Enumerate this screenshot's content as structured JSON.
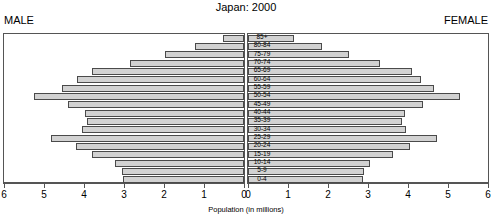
{
  "chart_data": {
    "type": "bar",
    "subtype": "population-pyramid",
    "title": "Japan: 2000",
    "xlabel": "Population (in millions)",
    "ylabel": "",
    "left_label": "MALE",
    "right_label": "FEMALE",
    "categories": [
      "0-4",
      "5-9",
      "10-14",
      "15-19",
      "20-24",
      "25-29",
      "30-34",
      "35-39",
      "40-44",
      "45-49",
      "50-54",
      "55-59",
      "60-64",
      "65-69",
      "70-74",
      "75-79",
      "80-84",
      "85+"
    ],
    "axis_ticks_left": [
      "6",
      "5",
      "4",
      "3",
      "2",
      "1",
      "0"
    ],
    "axis_ticks_right": [
      "0",
      "1",
      "2",
      "3",
      "4",
      "5",
      "6"
    ],
    "xlim": [
      0,
      6
    ],
    "grid": false,
    "legend": "none",
    "series": [
      {
        "name": "MALE",
        "side": "left",
        "values": [
          3.02,
          3.05,
          3.22,
          3.8,
          4.21,
          4.83,
          4.05,
          3.93,
          3.98,
          4.39,
          5.26,
          4.54,
          4.17,
          3.8,
          2.86,
          1.97,
          1.22,
          0.52
        ]
      },
      {
        "name": "FEMALE",
        "side": "right",
        "values": [
          2.87,
          2.9,
          3.06,
          3.62,
          4.06,
          4.73,
          3.96,
          3.86,
          3.93,
          4.37,
          5.3,
          4.64,
          4.33,
          4.09,
          3.29,
          2.52,
          1.86,
          1.14
        ]
      }
    ]
  }
}
